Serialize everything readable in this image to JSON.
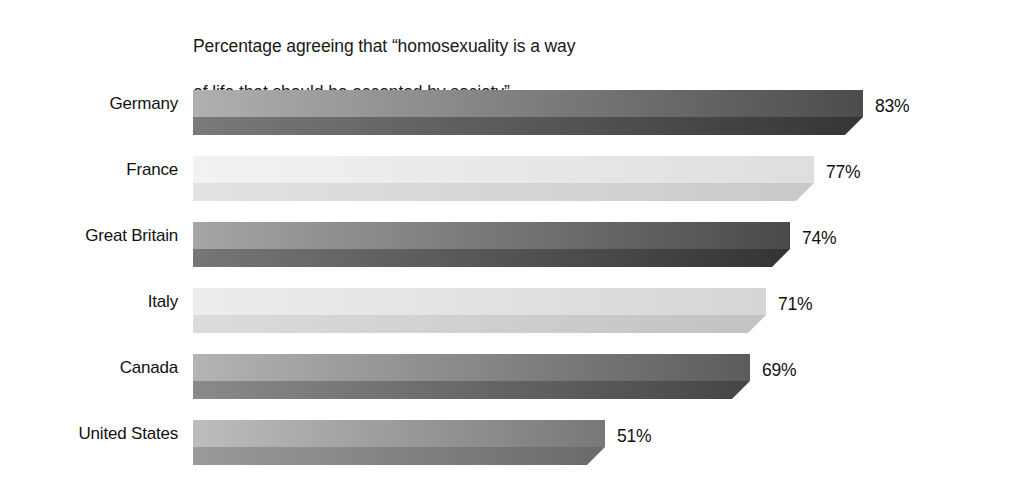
{
  "chart_data": {
    "type": "bar",
    "orientation": "horizontal",
    "title": "Percentage agreeing that “homosexuality is a way\nof life that should be accepted by society”",
    "title_line1": "Percentage agreeing that “homosexuality is a way",
    "title_line2": "of life that should be accepted by society”",
    "xlabel": "",
    "ylabel": "",
    "xlim": [
      0,
      100
    ],
    "grid": false,
    "legend": false,
    "axis_visible": false,
    "value_suffix": "%",
    "categories": [
      "Germany",
      "France",
      "Great Britain",
      "Italy",
      "Canada",
      "United States"
    ],
    "values": [
      83,
      77,
      74,
      71,
      69,
      51
    ],
    "bars": [
      {
        "category": "Germany",
        "value": 83,
        "value_label": "83%",
        "shade": "dark",
        "face_from": "#b0b0b0",
        "face_to": "#4c4c4c",
        "depth_from": "#7a7a7a",
        "depth_to": "#353535"
      },
      {
        "category": "France",
        "value": 77,
        "value_label": "77%",
        "shade": "light",
        "face_from": "#f2f2f2",
        "face_to": "#dedede",
        "depth_from": "#e2e2e2",
        "depth_to": "#c9c9c9"
      },
      {
        "category": "Great Britain",
        "value": 74,
        "value_label": "74%",
        "shade": "dark",
        "face_from": "#a5a5a5",
        "face_to": "#4a4a4a",
        "depth_from": "#767676",
        "depth_to": "#343434"
      },
      {
        "category": "Italy",
        "value": 71,
        "value_label": "71%",
        "shade": "light",
        "face_from": "#ededed",
        "face_to": "#d6d6d6",
        "depth_from": "#dcdcdc",
        "depth_to": "#c2c2c2"
      },
      {
        "category": "Canada",
        "value": 69,
        "value_label": "69%",
        "shade": "dark",
        "face_from": "#b4b4b4",
        "face_to": "#5c5c5c",
        "depth_from": "#8a8a8a",
        "depth_to": "#454545"
      },
      {
        "category": "United States",
        "value": 51,
        "value_label": "51%",
        "shade": "dark",
        "face_from": "#bdbdbd",
        "face_to": "#787878",
        "depth_from": "#9a9a9a",
        "depth_to": "#6a6a6a"
      }
    ],
    "colors": {
      "background": "#ffffff",
      "text": "#111111"
    }
  }
}
